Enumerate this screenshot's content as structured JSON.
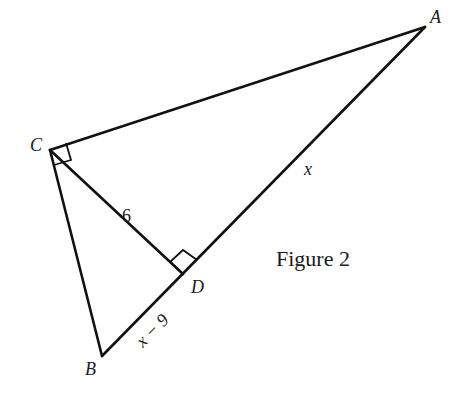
{
  "figure": {
    "caption": "Figure 2",
    "vertices": {
      "A": {
        "label": "A"
      },
      "B": {
        "label": "B"
      },
      "C": {
        "label": "C"
      },
      "D": {
        "label": "D"
      }
    },
    "segments": {
      "CD": {
        "label": "6"
      },
      "AD": {
        "label": "x"
      },
      "BD": {
        "label": "x − 9"
      }
    },
    "right_angles": [
      "ACB",
      "CDA"
    ],
    "colors": {
      "stroke": "#111111",
      "background": "#ffffff"
    }
  }
}
